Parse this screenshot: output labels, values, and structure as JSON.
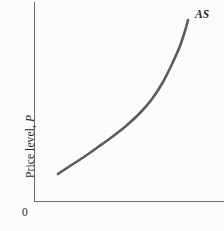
{
  "figure": {
    "background_color": "#fcfcfc",
    "axis_color": "#6b6b6b",
    "curve_color": "#5d5d5d",
    "text_color": "#2b2b2b",
    "origin_label": "0",
    "ylabel_text": "Price level, ",
    "ylabel_variable": "P",
    "curve_label": "AS"
  },
  "chart_data": {
    "type": "line",
    "title": "",
    "subtitle": "",
    "xlabel": "",
    "ylabel": "Price level, P",
    "grid": false,
    "legend": false,
    "annotations": [
      {
        "text": "AS",
        "x": 188,
        "y": 20,
        "style": "italic",
        "placement": "upper-right-of-curve-end"
      },
      {
        "text": "0",
        "x": 34,
        "y": 201,
        "placement": "origin"
      }
    ],
    "axes": {
      "x_axis": {
        "from": [
          34,
          201
        ],
        "to": [
          224,
          201
        ],
        "ticks": [],
        "ticklabels": []
      },
      "y_axis": {
        "from": [
          34,
          2
        ],
        "to": [
          34,
          201
        ],
        "ticks": [],
        "ticklabels": []
      },
      "xlim": [
        0,
        1
      ],
      "ylim": [
        0,
        1
      ],
      "units": "pixels (schematic, unscaled axes)"
    },
    "series": [
      {
        "name": "AS",
        "description": "Upward-sloping, convex aggregate supply curve becoming near-vertical at high output",
        "x": [
          58,
          70,
          84,
          98,
          112,
          126,
          140,
          152,
          163,
          172,
          180,
          185,
          188
        ],
        "y": [
          174,
          166,
          157,
          147,
          137,
          126,
          113,
          99,
          82,
          64,
          46,
          31,
          20
        ]
      }
    ]
  }
}
